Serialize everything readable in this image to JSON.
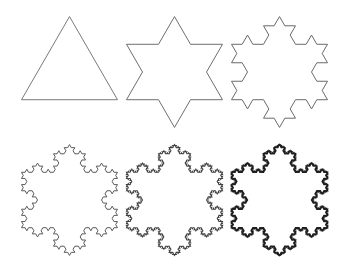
{
  "figures": [
    {
      "label": "Iteration 0",
      "iterations": 0,
      "cx": 69.5,
      "cy": 72,
      "side": 96,
      "stroke": "#7a7a7a",
      "width": 1.0
    },
    {
      "label": "Iteration 1",
      "iterations": 1,
      "cx": 174.5,
      "cy": 72,
      "side": 96,
      "stroke": "#6e6e6e",
      "width": 1.0
    },
    {
      "label": "Iteration 2",
      "iterations": 2,
      "cx": 279.5,
      "cy": 72,
      "side": 96,
      "stroke": "#6a6a6a",
      "width": 1.0
    },
    {
      "label": "Iteration 3",
      "iterations": 3,
      "cx": 69.5,
      "cy": 200,
      "side": 96,
      "stroke": "#5a5a5a",
      "width": 1.0
    },
    {
      "label": "Iteration 4",
      "iterations": 4,
      "cx": 174.5,
      "cy": 200,
      "side": 96,
      "stroke": "#404040",
      "width": 1.1
    },
    {
      "label": "Iteration 5",
      "iterations": 5,
      "cx": 279.5,
      "cy": 200,
      "side": 96,
      "stroke": "#1e1e1e",
      "width": 1.4
    }
  ]
}
